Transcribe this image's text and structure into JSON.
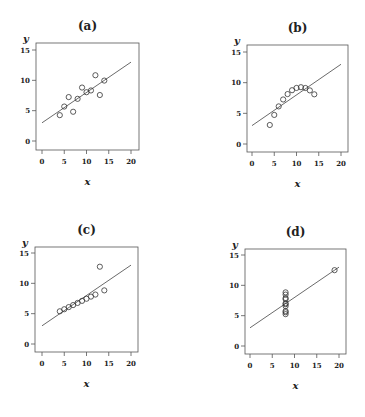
{
  "chart_data": [
    {
      "type": "scatter",
      "title": "(a)",
      "xlabel": "x",
      "ylabel": "y",
      "xlim": [
        0,
        20
      ],
      "ylim": [
        0,
        15
      ],
      "xticks": [
        0,
        5,
        10,
        15,
        20
      ],
      "yticks": [
        0,
        5,
        10,
        15
      ],
      "grid": false,
      "x": [
        10,
        8,
        13,
        9,
        11,
        14,
        6,
        4,
        12,
        7,
        5
      ],
      "y": [
        8.04,
        6.95,
        7.58,
        8.81,
        8.33,
        9.96,
        7.24,
        4.26,
        10.84,
        4.82,
        5.68
      ],
      "fit_line": {
        "intercept": 3.0,
        "slope": 0.5,
        "x_range": [
          0,
          20
        ]
      }
    },
    {
      "type": "scatter",
      "title": "(b)",
      "xlabel": "x",
      "ylabel": "y",
      "xlim": [
        0,
        20
      ],
      "ylim": [
        0,
        15
      ],
      "xticks": [
        0,
        5,
        10,
        15,
        20
      ],
      "yticks": [
        0,
        5,
        10,
        15
      ],
      "grid": false,
      "x": [
        10,
        8,
        13,
        9,
        11,
        14,
        6,
        4,
        12,
        7,
        5
      ],
      "y": [
        9.14,
        8.14,
        8.74,
        8.77,
        9.26,
        8.1,
        6.13,
        3.1,
        9.13,
        7.26,
        4.74
      ],
      "fit_line": {
        "intercept": 3.0,
        "slope": 0.5,
        "x_range": [
          0,
          20
        ]
      }
    },
    {
      "type": "scatter",
      "title": "(c)",
      "xlabel": "x",
      "ylabel": "y",
      "xlim": [
        0,
        20
      ],
      "ylim": [
        0,
        15
      ],
      "xticks": [
        0,
        5,
        10,
        15,
        20
      ],
      "yticks": [
        0,
        5,
        10,
        15
      ],
      "grid": false,
      "x": [
        10,
        8,
        13,
        9,
        11,
        14,
        6,
        4,
        12,
        7,
        5
      ],
      "y": [
        7.46,
        6.77,
        12.74,
        7.11,
        7.81,
        8.84,
        6.08,
        5.39,
        8.15,
        6.42,
        5.73
      ],
      "fit_line": {
        "intercept": 3.0,
        "slope": 0.5,
        "x_range": [
          0,
          20
        ]
      }
    },
    {
      "type": "scatter",
      "title": "(d)",
      "xlabel": "x",
      "ylabel": "y",
      "xlim": [
        0,
        20
      ],
      "ylim": [
        0,
        15
      ],
      "xticks": [
        0,
        5,
        10,
        15,
        20
      ],
      "yticks": [
        0,
        5,
        10,
        15
      ],
      "grid": false,
      "x": [
        8,
        8,
        8,
        8,
        8,
        8,
        8,
        19,
        8,
        8,
        8
      ],
      "y": [
        6.58,
        5.76,
        7.71,
        8.84,
        8.47,
        7.04,
        5.25,
        12.5,
        5.56,
        7.91,
        6.89
      ],
      "fit_line": {
        "intercept": 3.0,
        "slope": 0.5,
        "x_range": [
          0,
          20
        ]
      }
    }
  ],
  "colors": {
    "frame": "#555555",
    "line": "#444444",
    "marker": "#333333",
    "text": "#222222"
  }
}
